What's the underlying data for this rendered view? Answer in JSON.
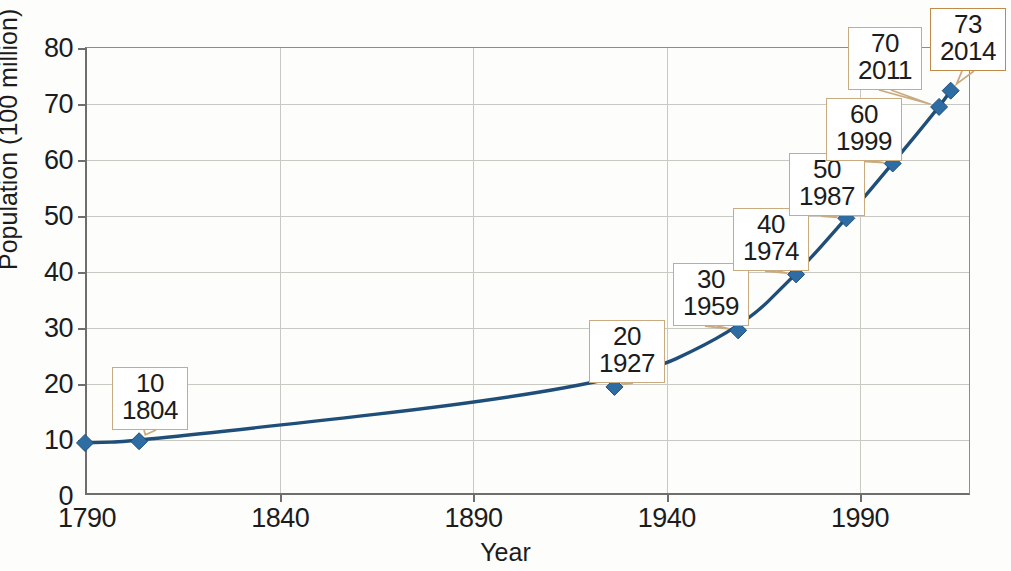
{
  "chart_data": {
    "type": "line",
    "title": "",
    "subtitle": "",
    "xlabel": "Year",
    "ylabel": "Population (100 million)",
    "xlim": [
      1790,
      2019
    ],
    "ylim": [
      0,
      80
    ],
    "xticks": [
      1790,
      1840,
      1890,
      1940,
      1990
    ],
    "yticks": [
      0,
      10,
      20,
      30,
      40,
      50,
      60,
      70,
      80
    ],
    "grid": true,
    "legend": false,
    "legend_position": "none",
    "series": [
      {
        "name": "Population",
        "line_color": "#1f4e79",
        "marker_color": "#2e6da4",
        "marker": "diamond",
        "x": [
          1790,
          1804,
          1927,
          1959,
          1974,
          1987,
          1999,
          2011,
          2014
        ],
        "y": [
          9.3,
          9.6,
          19.3,
          29.4,
          39.4,
          49.4,
          59.2,
          69.3,
          72.2
        ]
      }
    ],
    "annotations": [
      {
        "value": "10",
        "year": "1804",
        "point_index": 1,
        "box_x": 112,
        "box_y": 367,
        "accent": false
      },
      {
        "value": "20",
        "year": "1927",
        "point_index": 2,
        "box_x": 589,
        "box_y": 320,
        "accent": false
      },
      {
        "value": "30",
        "year": "1959",
        "point_index": 3,
        "box_x": 673,
        "box_y": 263,
        "accent": false
      },
      {
        "value": "40",
        "year": "1974",
        "point_index": 4,
        "box_x": 733,
        "box_y": 208,
        "accent": false
      },
      {
        "value": "50",
        "year": "1987",
        "point_index": 5,
        "box_x": 789,
        "box_y": 153,
        "accent": false
      },
      {
        "value": "60",
        "year": "1999",
        "point_index": 6,
        "box_x": 826,
        "box_y": 98,
        "accent": false
      },
      {
        "value": "70",
        "year": "2011",
        "point_index": 7,
        "box_x": 848,
        "box_y": 27,
        "accent": false
      },
      {
        "value": "73",
        "year": "2014",
        "point_index": 8,
        "box_x": 930,
        "box_y": 8,
        "accent": true
      }
    ]
  },
  "colors": {
    "line": "#1f4e79",
    "marker": "#2e6da4",
    "grid": "#c9c9c4",
    "axis": "#6e6e6e",
    "callout_border": "#c9ab80",
    "callout_accent": "#c08a4a",
    "leader": "#c9ab80",
    "text": "#1c1c1c",
    "background": "#fdfdfc"
  }
}
